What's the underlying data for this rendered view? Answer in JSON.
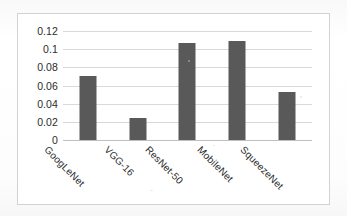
{
  "chart_data": {
    "type": "bar",
    "title": "",
    "subtitle": "",
    "xlabel": "",
    "ylabel": "",
    "categories": [
      "GoogLeNet",
      "VGG-16",
      "ResNet-50",
      "MobileNet",
      "SqueezeNet"
    ],
    "values": [
      0.071,
      0.024,
      0.107,
      0.109,
      0.053
    ],
    "ylim": [
      0,
      0.12
    ],
    "yticks": [
      0,
      0.02,
      0.04,
      0.06,
      0.08,
      0.1,
      0.12
    ],
    "ytick_labels": [
      "0",
      "0.02",
      "0.04",
      "0.06",
      "0.08",
      "0.1",
      "0.12"
    ],
    "grid": true,
    "grid_axis": "y",
    "legend": false,
    "legend_position": "none",
    "bar_color": "#595959",
    "grid_color": "#d9d9d9",
    "axis_color": "#bfbfbf",
    "plot_background": "#ffffff",
    "border_color": "#d2d2d2",
    "xtick_label_rotation": 45
  }
}
